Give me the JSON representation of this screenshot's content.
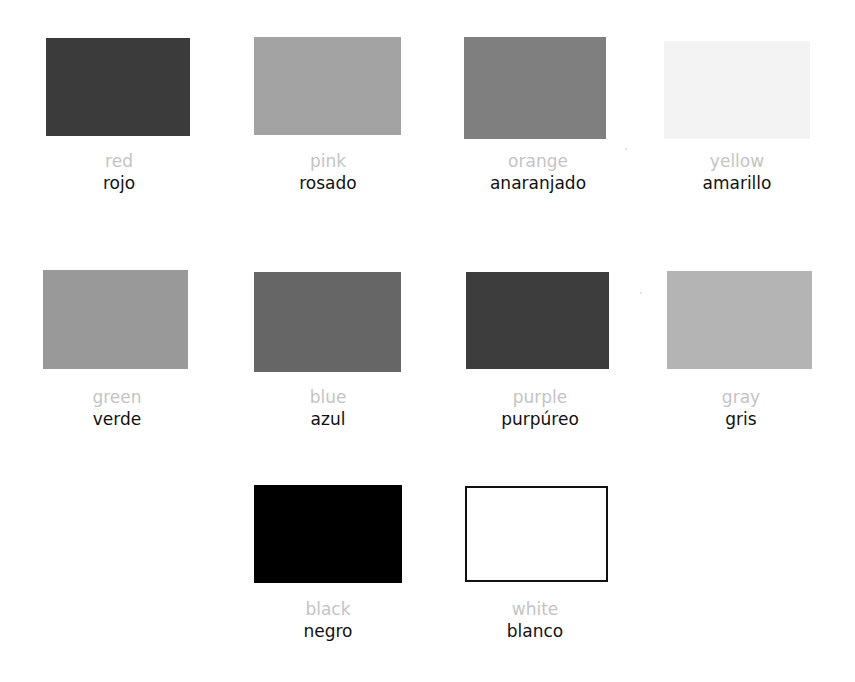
{
  "colors": [
    {
      "english": "red",
      "spanish": "rojo",
      "swatch": "#3b3b3b"
    },
    {
      "english": "pink",
      "spanish": "rosado",
      "swatch": "#a3a3a3"
    },
    {
      "english": "orange",
      "spanish": "anaranjado",
      "swatch": "#7f7f7f"
    },
    {
      "english": "yellow",
      "spanish": "amarillo",
      "swatch": "#f3f3f3"
    },
    {
      "english": "green",
      "spanish": "verde",
      "swatch": "#999999"
    },
    {
      "english": "blue",
      "spanish": "azul",
      "swatch": "#666666"
    },
    {
      "english": "purple",
      "spanish": "purpúreo",
      "swatch": "#3d3d3d"
    },
    {
      "english": "gray",
      "spanish": "gris",
      "swatch": "#b4b4b4"
    },
    {
      "english": "black",
      "spanish": "negro",
      "swatch": "#000000"
    },
    {
      "english": "white",
      "spanish": "blanco",
      "swatch": "#ffffff"
    }
  ]
}
